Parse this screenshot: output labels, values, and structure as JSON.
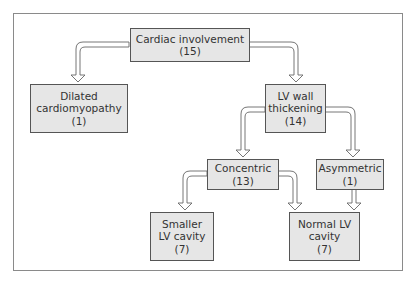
{
  "diagram": {
    "type": "flowchart-tree",
    "nodes": [
      {
        "id": "cardiac",
        "lines": [
          "Cardiac involvement",
          "(15)"
        ],
        "label": "Cardiac involvement",
        "count": 15
      },
      {
        "id": "dilated",
        "lines": [
          "Dilated",
          "cardiomyopathy",
          "(1)"
        ],
        "label": "Dilated cardiomyopathy",
        "count": 1
      },
      {
        "id": "lvwall",
        "lines": [
          "LV wall",
          "thickening",
          "(14)"
        ],
        "label": "LV wall thickening",
        "count": 14
      },
      {
        "id": "concentric",
        "lines": [
          "Concentric",
          "(13)"
        ],
        "label": "Concentric",
        "count": 13
      },
      {
        "id": "asymmetric",
        "lines": [
          "Asymmetric",
          "(1)"
        ],
        "label": "Asymmetric",
        "count": 1
      },
      {
        "id": "smaller",
        "lines": [
          "Smaller",
          "LV cavity",
          "(7)"
        ],
        "label": "Smaller LV cavity",
        "count": 7
      },
      {
        "id": "normal",
        "lines": [
          "Normal LV",
          "cavity",
          "(7)"
        ],
        "label": "Normal LV cavity",
        "count": 7
      }
    ],
    "edges": [
      {
        "from": "cardiac",
        "to": "dilated"
      },
      {
        "from": "cardiac",
        "to": "lvwall"
      },
      {
        "from": "lvwall",
        "to": "concentric"
      },
      {
        "from": "lvwall",
        "to": "asymmetric"
      },
      {
        "from": "concentric",
        "to": "smaller"
      },
      {
        "from": "concentric",
        "to": "normal"
      },
      {
        "from": "asymmetric",
        "to": "normal"
      }
    ],
    "colors": {
      "box_fill": "#e6e6e6",
      "box_border": "#555555",
      "arrow_fill": "#ffffff",
      "arrow_stroke": "#666666",
      "frame": "#8a8a8a"
    }
  }
}
